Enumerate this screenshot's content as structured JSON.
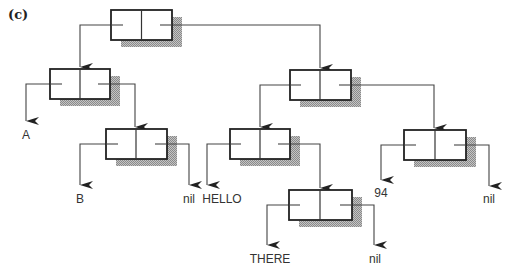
{
  "figure": {
    "panel_label": "(c)",
    "colors": {
      "box_stroke": "#222222",
      "shadow": "#9a9a9a",
      "line": "#444444",
      "background": "#ffffff"
    }
  },
  "nodes": [
    {
      "id": "root",
      "x": 111,
      "y": 10,
      "w": 61,
      "h": 30
    },
    {
      "id": "L1",
      "x": 50,
      "y": 69,
      "w": 60,
      "h": 30
    },
    {
      "id": "L2",
      "x": 106,
      "y": 129,
      "w": 61,
      "h": 30
    },
    {
      "id": "R1",
      "x": 290,
      "y": 70,
      "w": 61,
      "h": 30
    },
    {
      "id": "R2",
      "x": 230,
      "y": 129,
      "w": 60,
      "h": 30
    },
    {
      "id": "R3",
      "x": 404,
      "y": 130,
      "w": 62,
      "h": 30
    },
    {
      "id": "R4",
      "x": 289,
      "y": 190,
      "w": 63,
      "h": 30
    }
  ],
  "leaves": {
    "a": "A",
    "b": "B",
    "nil1": "nil",
    "hello": "HELLO",
    "there": "THERE",
    "nil2": "nil",
    "n94": "94",
    "nil3": "nil"
  }
}
